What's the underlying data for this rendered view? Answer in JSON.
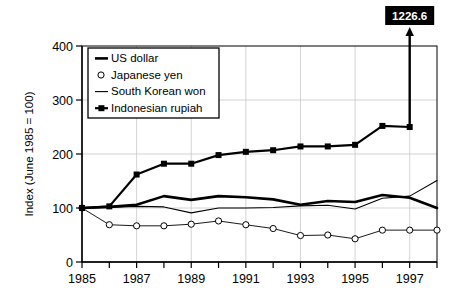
{
  "figure": {
    "background_color": "#ffffff",
    "line_color": "#000000",
    "grid_color": "#c8c8c8"
  },
  "chart_data": {
    "type": "line",
    "title": "",
    "subtitle": "",
    "xlabel": "",
    "ylabel": "Index (June 1985 = 100)",
    "xlim": [
      1985,
      1998
    ],
    "ylim": [
      0,
      400
    ],
    "ytick_values": [
      0,
      100,
      200,
      300,
      400
    ],
    "ytick_labels": [
      "0",
      "100",
      "200",
      "300",
      "400"
    ],
    "xtick_values": [
      1985,
      1986,
      1987,
      1988,
      1989,
      1990,
      1991,
      1992,
      1993,
      1994,
      1995,
      1996,
      1997,
      1998
    ],
    "xtick_labels": [
      "1985",
      "",
      "1987",
      "",
      "1989",
      "",
      "1991",
      "",
      "1993",
      "",
      "1995",
      "",
      "1997",
      ""
    ],
    "grid": "both",
    "legend_position": "upper-left",
    "x": [
      1985,
      1986,
      1987,
      1988,
      1989,
      1990,
      1991,
      1992,
      1993,
      1994,
      1995,
      1996,
      1997,
      1998
    ],
    "series": [
      {
        "name": "US dollar",
        "marker": "none",
        "line_width": 2.6,
        "color": "#000000",
        "values": [
          100,
          102,
          106,
          122,
          115,
          122,
          120,
          116,
          106,
          113,
          111,
          124,
          119,
          100
        ]
      },
      {
        "name": "Japanese yen",
        "marker": "open-circle",
        "line_width": 0.9,
        "color": "#000000",
        "values": [
          100,
          69,
          67,
          67,
          70,
          76,
          69,
          62,
          49,
          50,
          43,
          59,
          59,
          59
        ]
      },
      {
        "name": "South Korean won",
        "marker": "none",
        "line_width": 1.1,
        "color": "#000000",
        "values": [
          100,
          101,
          103,
          102,
          91,
          100,
          100,
          101,
          104,
          105,
          98,
          118,
          122,
          151
        ]
      },
      {
        "name": "Indonesian rupiah",
        "marker": "filled-square",
        "line_width": 2.2,
        "color": "#000000",
        "values": [
          100,
          103,
          162,
          182,
          182,
          198,
          204,
          207,
          214,
          214,
          217,
          252,
          250,
          null
        ]
      }
    ],
    "annotations": [
      {
        "text": "1226.6",
        "kind": "callout-arrow",
        "at_x": 1997,
        "at_y": 250,
        "points_to_value": 1226.6,
        "box_fill": "#000000",
        "text_color": "#ffffff"
      }
    ]
  }
}
